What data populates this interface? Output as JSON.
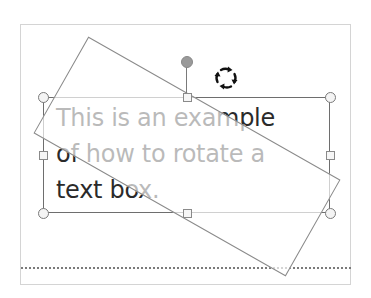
{
  "canvas": {
    "text_box": {
      "lines": [
        "This is an example",
        "of how to rotate a",
        "text box."
      ]
    }
  },
  "icons": {
    "rotate": "rotate-cursor-icon",
    "rotation_handle": "rotation-handle"
  },
  "colors": {
    "text": "#2a2a2a",
    "border": "#6e6e6e",
    "frame": "#d4d4d4",
    "handle_fill": "#f4f4f4"
  }
}
